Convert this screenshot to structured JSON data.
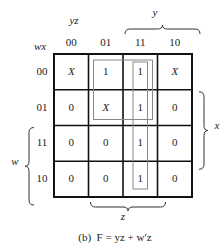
{
  "kmap": {
    "row_var_label": "wx",
    "col_var_label": "yz",
    "col_headers": [
      "00",
      "01",
      "11",
      "10"
    ],
    "row_headers": [
      "00",
      "01",
      "11",
      "10"
    ],
    "cells": [
      [
        "X",
        "1",
        "1",
        "X"
      ],
      [
        "0",
        "X",
        "1",
        "0"
      ],
      [
        "0",
        "0",
        "1",
        "0"
      ],
      [
        "0",
        "0",
        "1",
        "0"
      ]
    ],
    "brace_labels": {
      "top": "y",
      "right": "x",
      "left": "w",
      "bottom": "z"
    },
    "groups": [
      {
        "term": "w'z",
        "rows": [
          0,
          1
        ],
        "cols": [
          1,
          2
        ]
      },
      {
        "term": "yz",
        "rows": [
          0,
          3
        ],
        "cols": [
          2,
          2
        ]
      }
    ]
  },
  "caption": "(b)  F = yz + w′z"
}
